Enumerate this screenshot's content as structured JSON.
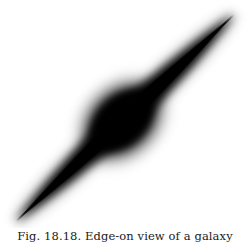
{
  "figure": {
    "image_description": "Edge-on galaxy: elongated dark disk with central bulge and thin bright dust lane, oriented diagonally from lower-left to upper-right",
    "caption": "Fig. 18.18. Edge-on view of a galaxy",
    "colors": {
      "background": "#ffffff",
      "galaxy": "#000000",
      "dust_lane": "#6a6a6a",
      "caption_text": "#1a1a1a"
    }
  }
}
